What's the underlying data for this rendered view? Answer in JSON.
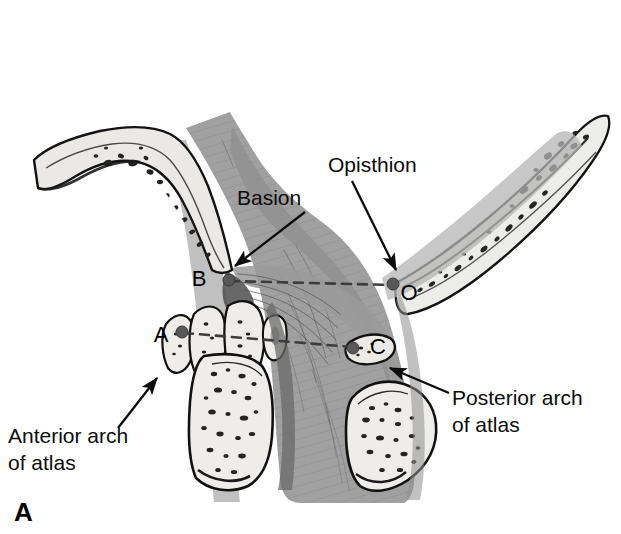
{
  "figure": {
    "panel_letter": "A",
    "background_color": "#ffffff",
    "ink_color": "#0b0b0b",
    "bone_fill_color": "#e9e8e4",
    "soft_tissue_color": "#a0a0a0",
    "soft_tissue_dark_color": "#7d7d7d",
    "ligament_shadow_color": "#5e5e5e",
    "marrow_color": "#2b2b2b",
    "dashed_line_color": "#4a4a4a",
    "point_marker_color": "#555555"
  },
  "annotations": [
    {
      "id": "basion",
      "label": "Basion",
      "lines": [
        "Basion"
      ],
      "text_x": 237,
      "text_y": 205,
      "arrow_from_x": 305,
      "arrow_from_y": 212,
      "arrow_to_x": 233,
      "arrow_to_y": 264
    },
    {
      "id": "opisthion",
      "label": "Opisthion",
      "lines": [
        "Opisthion"
      ],
      "text_x": 328,
      "text_y": 172,
      "arrow_from_x": 352,
      "arrow_from_y": 180,
      "arrow_to_x": 397,
      "arrow_to_y": 272
    },
    {
      "id": "anterior-arch-of-atlas",
      "label": "Anterior arch of atlas",
      "lines": [
        "Anterior arch",
        "of atlas"
      ],
      "text_x": 8,
      "text_y": 443,
      "arrow_from_x": 120,
      "arrow_from_y": 427,
      "arrow_to_x": 156,
      "arrow_to_y": 377
    },
    {
      "id": "posterior-arch-of-atlas",
      "label": "Posterior arch of atlas",
      "lines": [
        "Posterior arch",
        "of atlas"
      ],
      "text_x": 452,
      "text_y": 405,
      "arrow_from_x": 447,
      "arrow_from_y": 392,
      "arrow_to_x": 388,
      "arrow_to_y": 367
    }
  ],
  "landmarks": [
    {
      "id": "point-b",
      "label": "B",
      "point_x": 229,
      "point_y": 280,
      "label_x": 199,
      "label_y": 286
    },
    {
      "id": "point-o",
      "label": "O",
      "point_x": 393,
      "point_y": 284,
      "label_x": 403,
      "label_y": 300
    },
    {
      "id": "point-a",
      "label": "A",
      "point_x": 182,
      "point_y": 332,
      "label_x": 155,
      "label_y": 342
    },
    {
      "id": "point-c",
      "label": "C",
      "point_x": 353,
      "point_y": 348,
      "label_x": 371,
      "label_y": 354
    }
  ],
  "measurement_lines": [
    {
      "id": "bo-line",
      "from": "B",
      "to": "O",
      "x1": 230,
      "y1": 281,
      "x2": 392,
      "y2": 285,
      "style": "dashed"
    },
    {
      "id": "ac-line",
      "from": "A",
      "to": "C",
      "x1": 184,
      "y1": 333,
      "x2": 352,
      "y2": 347,
      "style": "dashed"
    }
  ],
  "anatomy_parts": [
    {
      "id": "clivus",
      "name": "clivus"
    },
    {
      "id": "occipital-bone",
      "name": "occipital bone"
    },
    {
      "id": "anterior-arch-atlas-shape",
      "name": "anterior arch of atlas"
    },
    {
      "id": "posterior-arch-atlas-shape",
      "name": "posterior arch of atlas"
    },
    {
      "id": "odontoid-process",
      "name": "odontoid process"
    },
    {
      "id": "axis-body",
      "name": "body of axis"
    },
    {
      "id": "c2-spinous-process",
      "name": "spinous process"
    },
    {
      "id": "tectorial-membrane",
      "name": "tectorial membrane"
    },
    {
      "id": "soft-tissue-mass",
      "name": "soft tissue"
    }
  ]
}
